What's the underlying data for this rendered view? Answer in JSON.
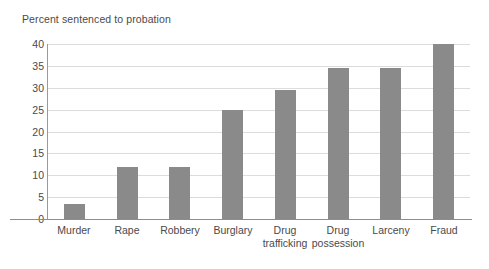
{
  "chart_data": {
    "type": "bar",
    "title": "Percent sentenced to probation",
    "xlabel": "",
    "ylabel": "",
    "ylim": [
      0,
      40
    ],
    "yticks": [
      0,
      5,
      10,
      15,
      20,
      25,
      30,
      35,
      40
    ],
    "grid": true,
    "legend": null,
    "bar_color": "#8a8a8a",
    "gridline_color": "#dcdcdc",
    "axis_color": "#8d8d8d",
    "background_color": "#ffffff",
    "categories": [
      "Murder",
      "Rape",
      "Robbery",
      "Burglary",
      "Drug trafficking",
      "Drug possession",
      "Larceny",
      "Fraud"
    ],
    "category_lines": [
      [
        "Murder"
      ],
      [
        "Rape"
      ],
      [
        "Robbery"
      ],
      [
        "Burglary"
      ],
      [
        "Drug",
        "trafficking"
      ],
      [
        "Drug",
        "possession"
      ],
      [
        "Larceny"
      ],
      [
        "Fraud"
      ]
    ],
    "values": [
      3.5,
      12,
      12,
      25,
      29.5,
      34.5,
      34.5,
      40
    ]
  }
}
